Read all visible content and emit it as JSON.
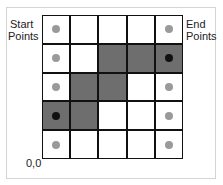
{
  "labels": {
    "start": [
      "Start",
      "Points"
    ],
    "end": [
      "End",
      "Points"
    ],
    "origin": "0,0"
  },
  "colors": {
    "filled": "#6e6e6e",
    "empty": "#ffffff",
    "dot_gray": "#9a9a9a",
    "dot_black": "#111111",
    "grid_line": "#111111"
  },
  "grid": {
    "rows": 5,
    "cols": 5,
    "filled_cells_row_col_top_down": [
      [
        1,
        2
      ],
      [
        1,
        3
      ],
      [
        1,
        4
      ],
      [
        2,
        1
      ],
      [
        2,
        2
      ],
      [
        3,
        0
      ],
      [
        3,
        1
      ]
    ],
    "gray_dots": [
      [
        0,
        0
      ],
      [
        1,
        0
      ],
      [
        2,
        0
      ],
      [
        4,
        0
      ],
      [
        0,
        4
      ],
      [
        2,
        4
      ],
      [
        3,
        4
      ],
      [
        4,
        4
      ]
    ],
    "black_dots": [
      [
        3,
        0
      ],
      [
        1,
        4
      ]
    ]
  }
}
